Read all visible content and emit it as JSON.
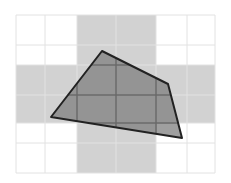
{
  "diagram": {
    "grid": {
      "x_lines": [
        16,
        45,
        77,
        116,
        156,
        187,
        215
      ],
      "y_lines": [
        15,
        45,
        65,
        95,
        123,
        143,
        173
      ],
      "line_color": "#e2e2e2",
      "background": "#ffffff"
    },
    "shaded_regions": [
      {
        "name": "vertical-band",
        "x": 77,
        "y": 15,
        "w": 79,
        "h": 158
      },
      {
        "name": "horizontal-band",
        "x": 16,
        "y": 65,
        "w": 199,
        "h": 58
      }
    ],
    "shade_color": "#d2d2d2",
    "polygon": {
      "points": [
        [
          102,
          51
        ],
        [
          168,
          84
        ],
        [
          182,
          138
        ],
        [
          51,
          117
        ]
      ],
      "fill": "#7f7f7f",
      "fill_opacity": 0.75,
      "stroke": "#222222",
      "stroke_width": 2
    },
    "interior_lines_color": "#6a6a6a"
  }
}
